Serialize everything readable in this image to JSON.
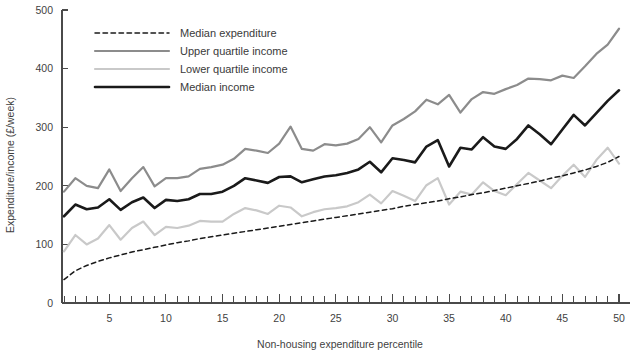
{
  "chart_data": {
    "type": "line",
    "title": "",
    "xlabel": "Non-housing expenditure percentile",
    "ylabel": "Expenditure/income (£/week)",
    "xlim": [
      1,
      50
    ],
    "ylim": [
      0,
      500
    ],
    "xticks": [
      5,
      10,
      15,
      20,
      25,
      30,
      35,
      40,
      45,
      50
    ],
    "xtick_labels": [
      "5",
      "10",
      "15",
      "20",
      "25",
      "30",
      "35",
      "40",
      "45",
      "50"
    ],
    "xtick_minor_step": 1,
    "yticks": [
      0,
      100,
      200,
      300,
      400,
      500
    ],
    "ytick_labels": [
      "0",
      "100",
      "200",
      "300",
      "400",
      "500"
    ],
    "grid": false,
    "legend_position": "top-left",
    "x": [
      1,
      2,
      3,
      4,
      5,
      6,
      7,
      8,
      9,
      10,
      11,
      12,
      13,
      14,
      15,
      16,
      17,
      18,
      19,
      20,
      21,
      22,
      23,
      24,
      25,
      26,
      27,
      28,
      29,
      30,
      31,
      32,
      33,
      34,
      35,
      36,
      37,
      38,
      39,
      40,
      41,
      42,
      43,
      44,
      45,
      46,
      47,
      48,
      49,
      50
    ],
    "series": [
      {
        "name": "Median expenditure",
        "style": "dashed",
        "color": "#1a1a1a",
        "width": 1.5,
        "values": [
          40,
          55,
          64,
          71,
          77,
          82,
          87,
          91,
          95,
          99,
          103,
          106,
          110,
          113,
          116,
          119,
          122,
          125,
          128,
          131,
          134,
          137,
          140,
          143,
          146,
          149,
          152,
          155,
          158,
          161,
          165,
          168,
          171,
          174,
          178,
          181,
          185,
          188,
          192,
          196,
          200,
          204,
          208,
          213,
          217,
          222,
          227,
          233,
          240,
          250
        ]
      },
      {
        "name": "Upper quartile income",
        "style": "solid",
        "color": "#8c8c8c",
        "width": 2.2,
        "values": [
          190,
          213,
          200,
          196,
          228,
          191,
          213,
          232,
          199,
          213,
          213,
          216,
          229,
          232,
          236,
          246,
          263,
          260,
          256,
          272,
          301,
          263,
          260,
          271,
          269,
          272,
          280,
          300,
          274,
          303,
          314,
          327,
          347,
          339,
          355,
          325,
          348,
          360,
          357,
          365,
          372,
          383,
          382,
          380,
          388,
          384,
          404,
          425,
          441,
          468
        ]
      },
      {
        "name": "Lower quartile income",
        "style": "solid",
        "color": "#c9c9c9",
        "width": 2.2,
        "values": [
          88,
          116,
          100,
          110,
          133,
          108,
          128,
          139,
          116,
          130,
          128,
          132,
          140,
          139,
          139,
          152,
          162,
          158,
          152,
          166,
          163,
          148,
          155,
          160,
          162,
          165,
          172,
          185,
          170,
          191,
          183,
          174,
          201,
          213,
          168,
          190,
          185,
          206,
          191,
          184,
          203,
          222,
          209,
          196,
          217,
          236,
          215,
          244,
          265,
          238
        ]
      },
      {
        "name": "Median income",
        "style": "solid",
        "color": "#1a1a1a",
        "width": 2.6,
        "values": [
          148,
          168,
          160,
          163,
          177,
          159,
          172,
          180,
          162,
          176,
          174,
          177,
          186,
          186,
          190,
          200,
          213,
          209,
          205,
          215,
          216,
          206,
          211,
          216,
          218,
          222,
          228,
          241,
          223,
          247,
          244,
          240,
          267,
          278,
          233,
          265,
          262,
          283,
          267,
          263,
          280,
          303,
          288,
          271,
          296,
          321,
          303,
          324,
          345,
          363
        ]
      }
    ]
  },
  "legend": {
    "items": [
      {
        "label": "Median expenditure"
      },
      {
        "label": "Upper quartile income"
      },
      {
        "label": "Lower quartile income"
      },
      {
        "label": "Median income"
      }
    ]
  }
}
